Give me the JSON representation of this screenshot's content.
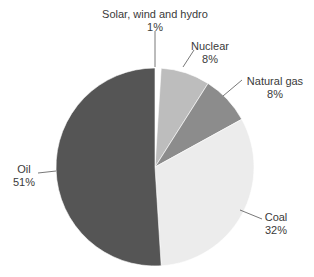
{
  "chart_data": {
    "type": "pie",
    "title": "",
    "start_angle_deg": 0,
    "direction": "clockwise",
    "slices": [
      {
        "label": "Solar, wind and hydro",
        "value": 1,
        "pct_label": "1%",
        "color": "#ffffff"
      },
      {
        "label": "Nuclear",
        "value": 8,
        "pct_label": "8%",
        "color": "#bdbdbd"
      },
      {
        "label": "Natural gas",
        "value": 8,
        "pct_label": "8%",
        "color": "#8c8c8c"
      },
      {
        "label": "Coal",
        "value": 32,
        "pct_label": "32%",
        "color": "#ececec"
      },
      {
        "label": "Oil",
        "value": 51,
        "pct_label": "51%",
        "color": "#555555"
      }
    ],
    "legend": "none (callout labels with leader lines)"
  },
  "labels": {
    "solar": {
      "name": "Solar, wind and hydro",
      "pct": "1%"
    },
    "nuclear": {
      "name": "Nuclear",
      "pct": "8%"
    },
    "gas": {
      "name": "Natural gas",
      "pct": "8%"
    },
    "coal": {
      "name": "Coal",
      "pct": "32%"
    },
    "oil": {
      "name": "Oil",
      "pct": "51%"
    }
  }
}
